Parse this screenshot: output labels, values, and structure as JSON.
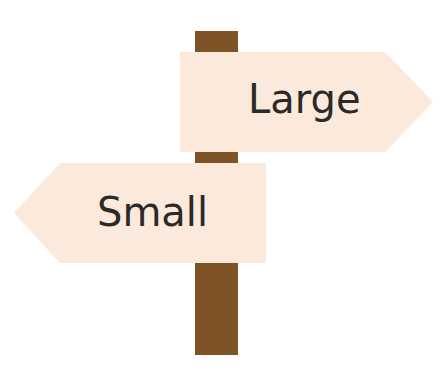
{
  "colors": {
    "post": "#7e5427",
    "sign": "#fbe9dc",
    "text": "#2b2a28",
    "background": "#ffffff"
  },
  "signs": [
    {
      "label": "Large",
      "direction": "right"
    },
    {
      "label": "Small",
      "direction": "left"
    }
  ]
}
